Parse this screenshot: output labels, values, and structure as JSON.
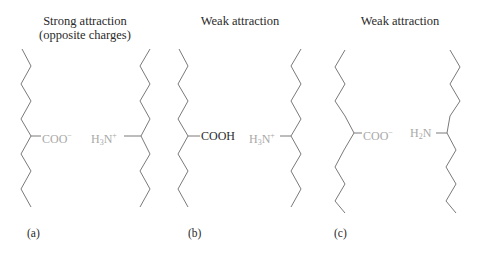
{
  "colors": {
    "chain": "#7a7a7a",
    "text_dark": "#2a2a2a",
    "text_dim": "#a8a8a8",
    "background": "#ffffff"
  },
  "panels": [
    {
      "id": "a",
      "title_line1": "Strong attraction",
      "title_line2": "(opposite charges)",
      "label": "(a)",
      "left_group": {
        "base": "COO",
        "sub": "",
        "sup": "−",
        "tail": "",
        "emphasis": "dim"
      },
      "right_group": {
        "base": "H",
        "sub": "3",
        "tail": "N",
        "sup": "+",
        "emphasis": "dim"
      }
    },
    {
      "id": "b",
      "title_line1": "Weak attraction",
      "title_line2": "",
      "label": "(b)",
      "left_group": {
        "base": "COOH",
        "sub": "",
        "sup": "",
        "tail": "",
        "emphasis": "dark"
      },
      "right_group": {
        "base": "H",
        "sub": "3",
        "tail": "N",
        "sup": "+",
        "emphasis": "dim"
      }
    },
    {
      "id": "c",
      "title_line1": "Weak attraction",
      "title_line2": "",
      "label": "(c)",
      "left_group": {
        "base": "COO",
        "sub": "",
        "sup": "−",
        "tail": "",
        "emphasis": "dim"
      },
      "right_group": {
        "base": "H",
        "sub": "2",
        "tail": "N",
        "sup": "",
        "emphasis": "dim"
      }
    }
  ]
}
